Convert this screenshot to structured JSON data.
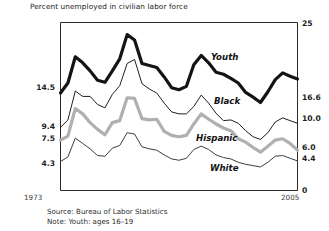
{
  "chart_data": {
    "type": "line",
    "title": "Percent unemployed in civilian labor force",
    "xlabel": "",
    "ylabel": "",
    "ylim": [
      0,
      25
    ],
    "xlim": [
      1973,
      2005
    ],
    "grid": false,
    "legend": "inline-labels",
    "axis_right_ticks": [
      "25",
      "16.6",
      "10.0",
      "6.0",
      "4.4",
      "0"
    ],
    "axis_left_ticks": [
      "14.5",
      "9.4",
      "7.5",
      "4.3"
    ],
    "x_start_label": "1973",
    "x_end_label": "2005",
    "series": [
      {
        "name": "Youth",
        "color": "#141414",
        "width": 3.2,
        "start_value": 14.5,
        "end_value": 16.6,
        "x": [
          1973,
          1974,
          1975,
          1976,
          1977,
          1978,
          1979,
          1980,
          1981,
          1982,
          1983,
          1984,
          1985,
          1986,
          1987,
          1988,
          1989,
          1990,
          1991,
          1992,
          1993,
          1994,
          1995,
          1996,
          1997,
          1998,
          1999,
          2000,
          2001,
          2002,
          2003,
          2004,
          2005
        ],
        "values": [
          14.5,
          16.0,
          19.9,
          19.0,
          17.8,
          16.4,
          16.1,
          17.8,
          19.6,
          23.2,
          22.4,
          18.9,
          18.6,
          18.3,
          16.9,
          15.3,
          15.0,
          15.5,
          18.7,
          20.1,
          19.0,
          17.6,
          17.3,
          16.7,
          16.0,
          14.6,
          13.9,
          13.1,
          14.7,
          16.5,
          17.5,
          17.0,
          16.6
        ]
      },
      {
        "name": "Black",
        "color": "#1f1f1f",
        "width": 1.0,
        "start_value": 9.4,
        "end_value": 10.0,
        "x": [
          1973,
          1974,
          1975,
          1976,
          1977,
          1978,
          1979,
          1980,
          1981,
          1982,
          1983,
          1984,
          1985,
          1986,
          1987,
          1988,
          1989,
          1990,
          1991,
          1992,
          1993,
          1994,
          1995,
          1996,
          1997,
          1998,
          1999,
          2000,
          2001,
          2002,
          2003,
          2004,
          2005
        ],
        "values": [
          9.4,
          10.5,
          14.8,
          14.0,
          14.0,
          12.8,
          12.3,
          14.3,
          15.6,
          18.9,
          19.5,
          15.9,
          15.1,
          14.5,
          13.0,
          11.7,
          11.4,
          11.4,
          12.5,
          14.2,
          13.0,
          11.5,
          10.4,
          10.5,
          10.0,
          8.9,
          8.0,
          7.6,
          8.6,
          10.2,
          10.8,
          10.4,
          10.0
        ]
      },
      {
        "name": "Hispanic",
        "color": "#b0b0b0",
        "width": 3.2,
        "start_value": 7.5,
        "end_value": 6.0,
        "x": [
          1973,
          1974,
          1975,
          1976,
          1977,
          1978,
          1979,
          1980,
          1981,
          1982,
          1983,
          1984,
          1985,
          1986,
          1987,
          1988,
          1989,
          1990,
          1991,
          1992,
          1993,
          1994,
          1995,
          1996,
          1997,
          1998,
          1999,
          2000,
          2001,
          2002,
          2003,
          2004,
          2005
        ],
        "values": [
          7.5,
          8.1,
          12.2,
          11.4,
          10.1,
          9.1,
          8.3,
          10.1,
          10.4,
          13.8,
          13.7,
          10.7,
          10.5,
          10.6,
          8.8,
          8.2,
          8.0,
          8.2,
          9.9,
          11.4,
          10.6,
          9.9,
          9.3,
          8.9,
          7.7,
          7.2,
          6.4,
          5.7,
          6.6,
          7.5,
          7.7,
          7.0,
          6.0
        ]
      },
      {
        "name": "White",
        "color": "#3d3d3d",
        "width": 1.0,
        "start_value": 4.3,
        "end_value": 4.4,
        "x": [
          1973,
          1974,
          1975,
          1976,
          1977,
          1978,
          1979,
          1980,
          1981,
          1982,
          1983,
          1984,
          1985,
          1986,
          1987,
          1988,
          1989,
          1990,
          1991,
          1992,
          1993,
          1994,
          1995,
          1996,
          1997,
          1998,
          1999,
          2000,
          2001,
          2002,
          2003,
          2004,
          2005
        ],
        "values": [
          4.3,
          5.0,
          7.8,
          7.0,
          6.2,
          5.2,
          5.1,
          6.3,
          6.7,
          8.6,
          8.4,
          6.5,
          6.2,
          6.0,
          5.3,
          4.7,
          4.5,
          4.8,
          6.1,
          6.6,
          6.1,
          5.3,
          4.9,
          4.7,
          4.2,
          3.9,
          3.7,
          3.5,
          4.2,
          5.1,
          5.2,
          4.8,
          4.4
        ]
      }
    ],
    "annotations": [
      {
        "text": "Youth",
        "x": 2113,
        "y": 56
      },
      {
        "text": "Black",
        "x": 2117,
        "y": 100
      },
      {
        "text": "Hispanic",
        "x": 2110,
        "y": 137
      },
      {
        "text": "White",
        "x": 2121,
        "y": 167
      }
    ]
  },
  "footnotes": {
    "source": "Source: Bureau of Labor Statistics",
    "note": "Note: Youth: ages 16–19"
  }
}
